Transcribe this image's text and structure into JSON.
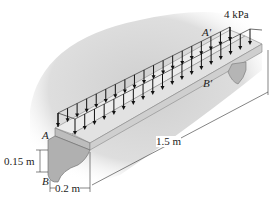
{
  "diagram": {
    "type": "distributed load on precast beam (3D view)",
    "load": {
      "label": "4 kPa",
      "value": 4,
      "unit": "kPa",
      "direction": "downward"
    },
    "points": {
      "A": "A",
      "A_prime": "A'",
      "B": "B",
      "B_prime": "B'"
    },
    "dimensions": {
      "height": "0.15 m",
      "width": "0.2 m",
      "length": "1.5 m"
    },
    "colors": {
      "background_shadow": "#d9d9d9",
      "beam_top": "#e6e6e6",
      "beam_side": "#c8c8c8",
      "arrow": "#111111"
    }
  }
}
